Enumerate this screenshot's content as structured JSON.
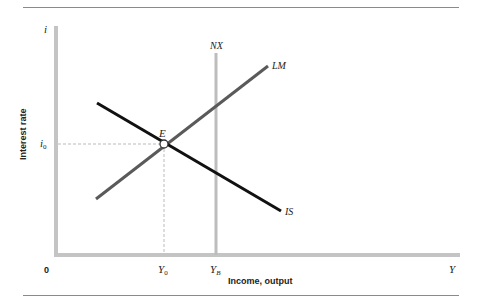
{
  "diagram": {
    "type": "IS-LM-NX diagram",
    "axes": {
      "y_axis_symbol": "i",
      "y_axis_label": "Interest rate",
      "x_axis_symbol": "Y",
      "x_axis_label": "Income, output",
      "origin_label": "0"
    },
    "curves": [
      {
        "name": "IS",
        "label": "IS",
        "color": "#111111",
        "slope": "downward"
      },
      {
        "name": "LM",
        "label": "LM",
        "color": "#5a5a5a",
        "slope": "upward"
      },
      {
        "name": "NX",
        "label": "NX",
        "color": "#bdbdbd",
        "slope": "vertical"
      }
    ],
    "equilibrium": {
      "point_label": "E",
      "i_label_main": "i",
      "i_label_sub": "0",
      "y_label_main": "Y",
      "y_label_sub": "0"
    },
    "nx_intercept": {
      "y_label_main": "Y",
      "y_label_sub": "B"
    },
    "colors": {
      "axis": "#c4c4c4",
      "is_curve": "#111111",
      "lm_curve": "#5a5a5a",
      "nx_curve": "#bdbdbd",
      "guide": "#bbbbbb",
      "rule": "#8a8a8a"
    }
  }
}
